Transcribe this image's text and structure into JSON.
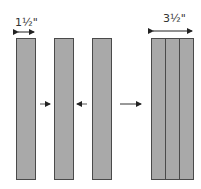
{
  "diagram": {
    "single_width_label": "1½\"",
    "combined_width_label": "3½\"",
    "colors": {
      "board_fill": "#a9a9a9",
      "board_outline": "#4a4a4a",
      "arrow": "#222222"
    },
    "boards": [
      {
        "name": "board-1",
        "x": 16,
        "width": 20
      },
      {
        "name": "board-2",
        "x": 54,
        "width": 20
      },
      {
        "name": "board-3",
        "x": 92,
        "width": 20
      }
    ],
    "combined_block": {
      "x": 151,
      "width": 43,
      "dividers": [
        165,
        179
      ]
    },
    "arrows": [
      {
        "name": "push-right-arrow",
        "direction": "right"
      },
      {
        "name": "push-left-arrow",
        "direction": "left"
      },
      {
        "name": "result-arrow",
        "direction": "right"
      }
    ]
  }
}
